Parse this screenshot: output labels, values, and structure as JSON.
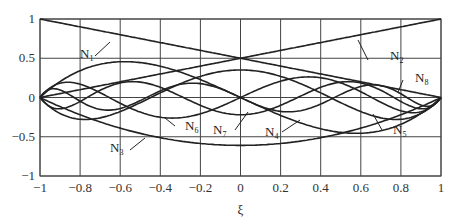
{
  "chart_data": {
    "type": "line",
    "title": "",
    "xlabel": "ξ",
    "ylabel": "",
    "xlim": [
      -1,
      1
    ],
    "ylim": [
      -1,
      1
    ],
    "grid": true,
    "xticks": [
      "-1",
      "-0.8",
      "-0.6",
      "-0.4",
      "-0.2",
      "0",
      "0.2",
      "0.4",
      "0.6",
      "0.8",
      "1"
    ],
    "yticks": [
      "1",
      "0.5",
      "0",
      "-0.5",
      "-1"
    ],
    "series": [
      {
        "name": "N1",
        "formula": "(1-ξ)/2",
        "x": [
          -1,
          0,
          1
        ],
        "values": [
          1,
          0.5,
          0
        ]
      },
      {
        "name": "N2",
        "formula": "(1+ξ)/2",
        "x": [
          -1,
          0,
          1
        ],
        "values": [
          0,
          0.5,
          1
        ]
      },
      {
        "name": "N3",
        "formula": "hierarchical quadratic",
        "x": [
          -1,
          -0.5,
          0,
          0.5,
          1
        ],
        "values": [
          0,
          -0.46,
          -0.61,
          -0.46,
          0
        ]
      },
      {
        "name": "N4",
        "formula": "hierarchical cubic",
        "x": [
          -1,
          -0.58,
          0,
          0.58,
          1
        ],
        "values": [
          0,
          0.24,
          0,
          -0.24,
          0
        ]
      },
      {
        "name": "N5",
        "formula": "hierarchical quartic",
        "x": [
          -1,
          -0.5,
          0,
          0.5,
          1
        ],
        "values": [
          0,
          -0.1,
          0.2,
          -0.1,
          0
        ]
      },
      {
        "name": "N6",
        "formula": "hierarchical quintic",
        "x": [
          -1,
          -0.75,
          -0.3,
          0.3,
          0.75,
          1
        ],
        "values": [
          0,
          -0.12,
          0.1,
          -0.1,
          0.12,
          0
        ]
      },
      {
        "name": "N7",
        "formula": "hierarchical 6th order",
        "values": []
      },
      {
        "name": "N8",
        "formula": "hierarchical 7th order",
        "values": []
      }
    ],
    "annotations": [
      "N1",
      "N2",
      "N3",
      "N4",
      "N5",
      "N6",
      "N7",
      "N8"
    ]
  },
  "labels": {
    "n1": "N",
    "n2": "N",
    "n3": "N",
    "n4": "N",
    "n5": "N",
    "n6": "N",
    "n7": "N",
    "n8": "N",
    "s1": "1",
    "s2": "2",
    "s3": "3",
    "s4": "4",
    "s5": "5",
    "s6": "6",
    "s7": "7",
    "s8": "8",
    "xlabel": "ξ"
  }
}
